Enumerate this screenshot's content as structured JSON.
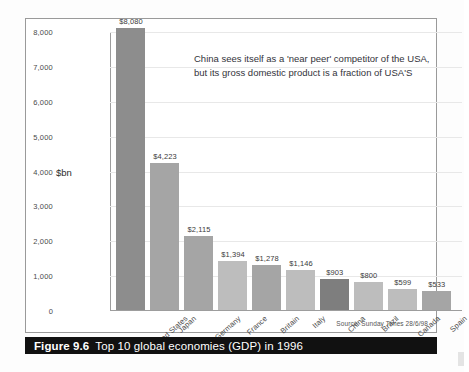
{
  "figure": {
    "caption_number": "Figure 9.6",
    "caption_text": "Top 10 global economies (GDP) in 1996",
    "source_note": "Source: Sunday Times 28/6/98"
  },
  "annotation": {
    "line1": "China sees itself as a 'near peer' competitor of the USA,",
    "line2": "but its gross domestic product is a fraction of USA'S"
  },
  "chart_data": {
    "type": "bar",
    "title": "Top 10 global economies (GDP) in 1996",
    "xlabel": "",
    "ylabel": "$bn",
    "ylim": [
      0,
      8000
    ],
    "grid": true,
    "legend": "none",
    "categories": [
      "United States",
      "Japan",
      "Germany",
      "France",
      "Britain",
      "Italy",
      "China",
      "Brazil",
      "Canada",
      "Spain"
    ],
    "values": [
      8080,
      4223,
      2115,
      1394,
      1278,
      1146,
      903,
      800,
      599,
      533
    ],
    "value_labels": [
      "$8,080",
      "$4,223",
      "$2,115",
      "$1,394",
      "$1,278",
      "$1,146",
      "$903",
      "$800",
      "$599",
      "$533"
    ],
    "bar_shades": [
      "shade-dark",
      "shade-mid",
      "shade-mid",
      "shade-light",
      "shade-mid",
      "shade-light",
      "shade-china",
      "shade-light",
      "shade-light",
      "shade-mid"
    ],
    "yticks": [
      0,
      1000,
      2000,
      3000,
      4000,
      5000,
      6000,
      7000,
      8000
    ],
    "ytick_labels": [
      "0",
      "1,000",
      "2,000",
      "3,000",
      "4,000",
      "5,000",
      "6,000",
      "7,000",
      "8,000"
    ],
    "colors": {
      "bar_default": "#a8a8a8",
      "bar_highlight": "#7e7e7e",
      "gridline": "#e8e8e8",
      "axis": "#9d9d9d",
      "caption_background": "#111111",
      "caption_text": "#ffffff"
    }
  }
}
